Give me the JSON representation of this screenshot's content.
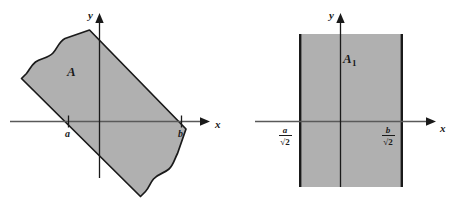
{
  "figure": {
    "kind": "math-diagram",
    "width": 462,
    "height": 205,
    "background_color": "#ffffff",
    "shade_color": "#b0b0b0",
    "outline_color": "#1a1a1a",
    "axis_color": "#595959"
  },
  "panels": [
    {
      "id": "left",
      "region_label": "A",
      "axis": {
        "x_label": "x",
        "y_label": "y"
      },
      "tick_labels": [
        {
          "name": "a",
          "text": "a"
        },
        {
          "name": "b",
          "text": "b"
        }
      ]
    },
    {
      "id": "right",
      "region_label": "A",
      "region_label_subscript": "1",
      "axis": {
        "x_label": "x",
        "y_label": "y"
      },
      "tick_labels": [
        {
          "name": "a-over-sqrt2",
          "numerator": "a",
          "denominator": "√2"
        },
        {
          "name": "b-over-sqrt2",
          "numerator": "b",
          "denominator": "√2"
        }
      ]
    }
  ]
}
